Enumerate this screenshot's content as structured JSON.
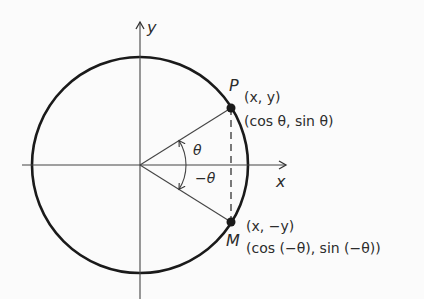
{
  "diagram": {
    "axes": {
      "x_label": "x",
      "y_label": "y"
    },
    "angles": {
      "positive": "θ",
      "negative": "−θ"
    },
    "points": {
      "P": {
        "name": "P",
        "coords": "(x, y)",
        "trig": "(cos θ, sin θ)"
      },
      "M": {
        "name": "M",
        "coords": "(x, −y)",
        "trig": "(cos (−θ), sin (−θ))"
      }
    },
    "colors": {
      "stroke": "#1a1a1a",
      "background": "#fbfbfb"
    }
  }
}
